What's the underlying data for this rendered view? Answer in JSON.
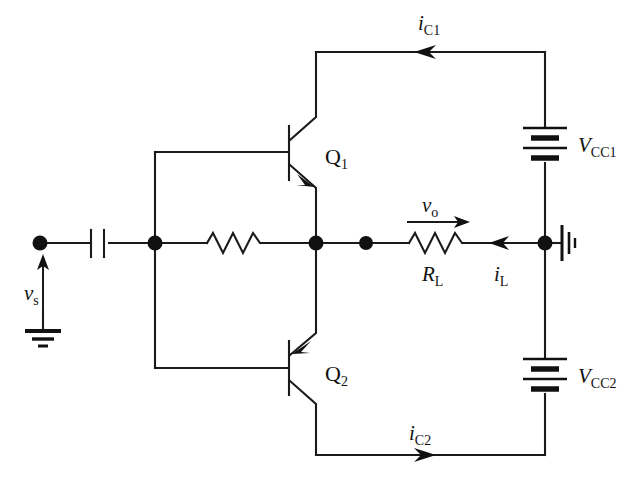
{
  "figure": {
    "kind": "circuit-schematic",
    "background_color": "#ffffff",
    "line_color": "#1a1a1a"
  },
  "labels": {
    "i_c1": {
      "symbol": "i",
      "subscript": "C1",
      "text": "iC1"
    },
    "i_c2": {
      "symbol": "i",
      "subscript": "C2",
      "text": "iC2"
    },
    "i_l": {
      "symbol": "i",
      "subscript": "L",
      "text": "iL"
    },
    "v_o": {
      "symbol": "v",
      "subscript": "o",
      "text": "vo"
    },
    "v_s": {
      "symbol": "v",
      "subscript": "s",
      "text": "vs"
    },
    "r_l": {
      "symbol": "R",
      "subscript": "L",
      "text": "RL"
    },
    "q1": {
      "symbol": "Q",
      "subscript": "1",
      "text": "Q1"
    },
    "q2": {
      "symbol": "Q",
      "subscript": "2",
      "text": "Q2"
    },
    "vcc1": {
      "symbol": "V",
      "subscript": "CC1",
      "text": "VCC1"
    },
    "vcc2": {
      "symbol": "V",
      "subscript": "CC2",
      "text": "VCC2"
    }
  },
  "components": [
    {
      "name": "input-capacitor",
      "type": "capacitor",
      "label": ""
    },
    {
      "name": "bias-resistor",
      "type": "resistor",
      "label": ""
    },
    {
      "name": "load-resistor",
      "type": "resistor",
      "label": "RL"
    },
    {
      "name": "transistor-q1",
      "type": "bjt-npn",
      "label": "Q1"
    },
    {
      "name": "transistor-q2",
      "type": "bjt-pnp",
      "label": "Q2"
    },
    {
      "name": "battery-vcc1",
      "type": "battery",
      "label": "VCC1"
    },
    {
      "name": "battery-vcc2",
      "type": "battery",
      "label": "VCC2"
    },
    {
      "name": "source-ground",
      "type": "ground",
      "label": ""
    },
    {
      "name": "supply-ground",
      "type": "ground-rotated",
      "label": ""
    }
  ],
  "currents": [
    {
      "name": "ic1",
      "label": "iC1",
      "direction": "left"
    },
    {
      "name": "ic2",
      "label": "iC2",
      "direction": "right"
    },
    {
      "name": "il",
      "label": "iL",
      "direction": "left"
    }
  ],
  "voltages": [
    {
      "name": "vo",
      "label": "vo",
      "direction": "right"
    },
    {
      "name": "vs",
      "label": "vs",
      "direction": "up"
    }
  ]
}
